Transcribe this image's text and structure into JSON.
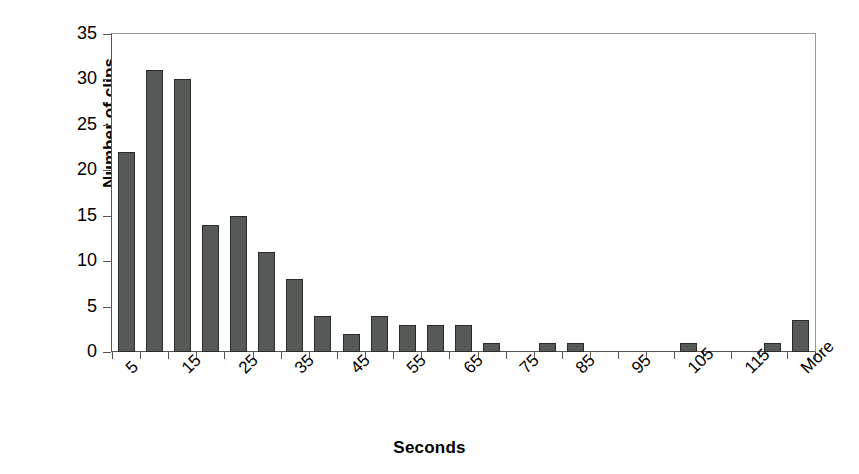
{
  "chart_data": {
    "type": "bar",
    "title": "",
    "subtitle": "",
    "xlabel": "Seconds",
    "ylabel": "Number of clips",
    "grid": false,
    "legend": "none",
    "ylim": [
      0,
      35
    ],
    "y_ticks": [
      0,
      5,
      10,
      15,
      20,
      25,
      30,
      35
    ],
    "y_tick_labels": [
      "0",
      "5",
      "10",
      "15",
      "20",
      "25",
      "30",
      "35"
    ],
    "categories": [
      "5",
      "10",
      "15",
      "20",
      "25",
      "30",
      "35",
      "40",
      "45",
      "50",
      "55",
      "60",
      "65",
      "70",
      "75",
      "80",
      "85",
      "90",
      "95",
      "100",
      "105",
      "110",
      "115",
      "120",
      "More"
    ],
    "x_tick_labels_shown": [
      "5",
      "15",
      "25",
      "35",
      "45",
      "55",
      "65",
      "75",
      "85",
      "95",
      "105",
      "115",
      "More"
    ],
    "values": [
      22,
      31,
      30,
      14,
      15,
      11,
      8,
      4,
      2,
      4,
      3,
      3,
      3,
      1,
      0,
      1,
      1,
      0,
      0,
      0,
      1,
      0,
      0,
      1,
      3.5
    ],
    "series": [
      {
        "name": "Number of clips",
        "values": [
          22,
          31,
          30,
          14,
          15,
          11,
          8,
          4,
          2,
          4,
          3,
          3,
          3,
          1,
          0,
          1,
          1,
          0,
          0,
          0,
          1,
          0,
          0,
          1,
          3.5
        ]
      }
    ],
    "bar_color": "#565a56",
    "bar_edge_color": "#2a2c2a",
    "plot_border_color": "#9a9a9a",
    "axis_color": "#555555",
    "background_color": "#ffffff"
  }
}
